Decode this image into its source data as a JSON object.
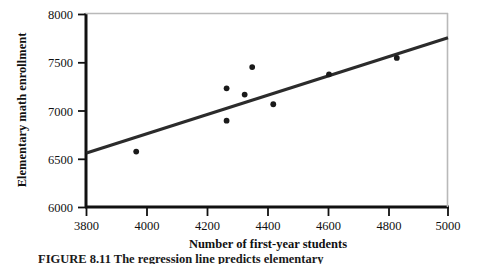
{
  "figure": {
    "caption": "FIGURE 8.11   The regression line predicts elementary"
  },
  "chart_data": {
    "type": "scatter",
    "title": "",
    "xlabel": "Number of first-year students",
    "ylabel": "Elementary math enrollment",
    "xlim": [
      3800,
      5000
    ],
    "ylim": [
      6000,
      8000
    ],
    "xticks": [
      3800,
      4000,
      4200,
      4400,
      4600,
      4800,
      5000
    ],
    "yticks": [
      6000,
      6500,
      7000,
      7500,
      8000
    ],
    "xtick_labels": [
      "3800",
      "4000",
      "4200",
      "4400",
      "4600",
      "4800",
      "5000"
    ],
    "ytick_labels": [
      "6000",
      "6500",
      "7000",
      "7500",
      "8000"
    ],
    "grid": false,
    "legend": "none",
    "marker_color": "#1a1a1a",
    "line_color": "#2b2b2b",
    "axis_color": "#111111",
    "points": [
      {
        "x": 3965,
        "y": 6580
      },
      {
        "x": 4265,
        "y": 7235
      },
      {
        "x": 4265,
        "y": 6900
      },
      {
        "x": 4325,
        "y": 7170
      },
      {
        "x": 4350,
        "y": 7455
      },
      {
        "x": 4420,
        "y": 7070
      },
      {
        "x": 4605,
        "y": 7380
      },
      {
        "x": 4830,
        "y": 7550
      }
    ],
    "series": [
      {
        "name": "Elementary math enrollment",
        "x": [
          3965,
          4265,
          4265,
          4325,
          4350,
          4420,
          4605,
          4830
        ],
        "values": [
          6580,
          7235,
          6900,
          7170,
          7455,
          7070,
          7380,
          7550
        ]
      }
    ],
    "regression_line": {
      "name": "Least-squares regression line",
      "x_start": 3800,
      "y_start": 6565,
      "x_end": 5000,
      "y_end": 7760
    }
  }
}
